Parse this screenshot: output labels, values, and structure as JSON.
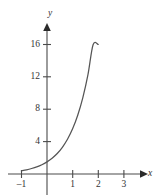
{
  "chart_data": {
    "type": "line",
    "title": "",
    "subtitle": "",
    "xlabel": "x",
    "ylabel": "y",
    "xlim": [
      -1.3,
      3.75
    ],
    "ylim": [
      -1.2,
      19.0
    ],
    "grid": false,
    "legend": null,
    "axis_style": "arrowed-cartesian",
    "curve_color": "#555555",
    "axis_color": "#4a4a4a",
    "label_color": "#333333",
    "background": "#ffffff",
    "xticks": [
      -1,
      1,
      2,
      3
    ],
    "xtick_labels": [
      "–1",
      "1",
      "2",
      "3"
    ],
    "yticks": [
      4,
      8,
      12,
      16
    ],
    "ytick_labels": [
      "4",
      "8",
      "12",
      "16"
    ],
    "series": [
      {
        "name": "exponential",
        "x": [
          -1.0,
          -0.8,
          -0.6,
          -0.4,
          -0.2,
          0.0,
          0.2,
          0.4,
          0.6,
          0.8,
          1.0,
          1.2,
          1.4,
          1.6,
          1.8,
          2.0,
          2.2,
          2.4,
          2.6,
          2.8,
          3.0
        ],
        "y": [
          0.4,
          0.52,
          0.68,
          0.88,
          1.15,
          1.5,
          1.95,
          2.53,
          3.3,
          4.29,
          5.58,
          7.26,
          9.44,
          12.28,
          15.97,
          16.0,
          16.0,
          16.0,
          16.0,
          16.0,
          16.0
        ]
      }
    ],
    "annotations": []
  },
  "figure": {
    "y_axis_label": "y",
    "x_axis_label": "x",
    "y_tick_16": "16",
    "y_tick_12": "12",
    "y_tick_8": "8",
    "y_tick_4": "4",
    "x_tick_neg1": "–1",
    "x_tick_1": "1",
    "x_tick_2": "2",
    "x_tick_3": "3"
  }
}
